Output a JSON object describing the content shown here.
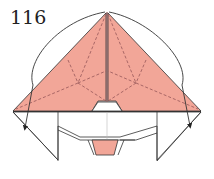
{
  "step": {
    "number": "116"
  },
  "diagram": {
    "colors": {
      "paper_colored": "#F2A698",
      "paper_white": "#FFFFFF",
      "line": "#333333",
      "crease": "#A06060"
    },
    "elements": [
      "apex-point",
      "left-pink-flap",
      "right-pink-flap",
      "center-vertical-edge",
      "valley-fold-dashed-creases",
      "white-lower-body",
      "center-notch",
      "bottom-pink-tab",
      "left-fold-arrow",
      "right-fold-arrow"
    ]
  }
}
